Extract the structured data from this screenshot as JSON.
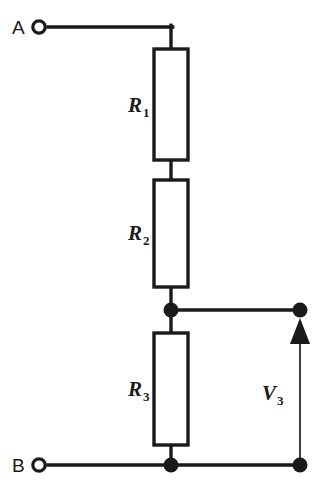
{
  "figure": {
    "type": "schematic",
    "background_color": "#ffffff",
    "line_color": "#1a1a1a",
    "width": 321,
    "height": 496
  },
  "terminals": [
    {
      "id": "A",
      "label": "A",
      "style": "open-circle",
      "x": 37,
      "y": 27
    },
    {
      "id": "B",
      "label": "B",
      "style": "open-circle",
      "x": 37,
      "y": 465
    },
    {
      "id": "out-top",
      "label": "",
      "style": "filled-dot",
      "x": 300,
      "y": 310
    },
    {
      "id": "out-bottom",
      "label": "",
      "style": "filled-dot",
      "x": 300,
      "y": 465
    }
  ],
  "components": [
    {
      "id": "R1",
      "type": "resistor",
      "base": "R",
      "subscript": "1",
      "label_x": 136,
      "label_y": 112,
      "box": {
        "x": 154,
        "y": 49,
        "w": 34,
        "h": 111
      }
    },
    {
      "id": "R2",
      "type": "resistor",
      "base": "R",
      "subscript": "2",
      "label_x": 136,
      "label_y": 240,
      "box": {
        "x": 154,
        "y": 180,
        "w": 34,
        "h": 107
      }
    },
    {
      "id": "R3",
      "type": "resistor",
      "base": "R",
      "subscript": "3",
      "label_x": 136,
      "label_y": 396,
      "box": {
        "x": 154,
        "y": 333,
        "w": 34,
        "h": 112
      }
    }
  ],
  "measurements": [
    {
      "id": "V3",
      "base": "V",
      "subscript": "3",
      "label_x": 268,
      "label_y": 400,
      "arrow_direction": "up",
      "from_y": 465,
      "to_y": 318,
      "x": 300
    }
  ],
  "junctions": [
    {
      "id": "node-mid",
      "x": 171,
      "y": 310,
      "r": 7
    },
    {
      "id": "node-bottom",
      "x": 171,
      "y": 465,
      "r": 7
    }
  ],
  "wires": [
    {
      "id": "wire-a-horizontal",
      "d": "M 48 27 L 171 27"
    },
    {
      "id": "wire-a-down",
      "d": "M 171 27 L 171 49"
    },
    {
      "id": "wire-r1-r2",
      "d": "M 171 160 L 171 180"
    },
    {
      "id": "wire-r2-node",
      "d": "M 171 287 L 171 310"
    },
    {
      "id": "wire-node-r3",
      "d": "M 171 310 L 171 333"
    },
    {
      "id": "wire-r3-bottom",
      "d": "M 171 445 L 171 465"
    },
    {
      "id": "wire-node-out",
      "d": "M 171 310 L 300 310"
    },
    {
      "id": "wire-b-rail",
      "d": "M 48 465 L 300 465"
    }
  ]
}
